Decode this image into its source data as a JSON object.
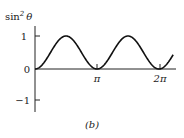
{
  "chart_data": {
    "type": "line",
    "title": "",
    "ylabel": "sin² θ",
    "xlabel": "",
    "caption": "(b)",
    "x_ticks": [
      "π",
      "2π"
    ],
    "y_ticks": [
      "1",
      "0",
      "−1"
    ],
    "ylim": [
      -1.3,
      1.3
    ],
    "xlim": [
      0,
      7.0
    ],
    "grid": false,
    "series": [
      {
        "name": "sin² θ",
        "function": "sin^2(x)",
        "x_range": [
          0,
          7.0
        ]
      }
    ]
  },
  "labels": {
    "ylabel_base": "sin",
    "ylabel_exp": "2",
    "ylabel_var": "θ",
    "tick_pi": "π",
    "tick_2pi": "2π",
    "tick_1": "1",
    "tick_0": "0",
    "tick_m1": "−1",
    "caption": "(b)"
  }
}
